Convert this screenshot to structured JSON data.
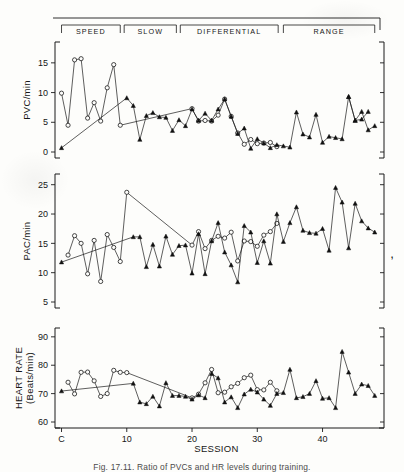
{
  "figure": {
    "caption": "Fig. 17.11.  Ratio of PVCs and HR levels during training.",
    "phases": [
      {
        "label": "SPEED",
        "start_session": 0.0,
        "end_session": 9.0
      },
      {
        "label": "SLOW",
        "start_session": 9.6,
        "end_session": 17.6
      },
      {
        "label": "DIFFERENTIAL",
        "start_session": 18.2,
        "end_session": 33.2
      },
      {
        "label": "RANGE",
        "start_session": 34.0,
        "end_session": 48.0
      }
    ],
    "x_axis": {
      "label": "SESSION",
      "tick_labels": [
        "C",
        "10",
        "20",
        "30",
        "40"
      ],
      "tick_values": [
        0,
        10,
        20,
        30,
        40
      ],
      "min": -1,
      "max": 48.5
    },
    "legend": {
      "open_marker": "open-circle-square",
      "filled_marker": "filled-triangle"
    }
  },
  "chart_data": [
    {
      "type": "line",
      "panel": "top",
      "title": "",
      "xlabel": "",
      "ylabel": "PVC/min",
      "ylim": [
        0,
        17.5
      ],
      "xlim": [
        -1,
        48.5
      ],
      "ytick_labels": [
        "0",
        "5",
        "10",
        "15"
      ],
      "ytick_values": [
        0,
        5,
        10,
        15
      ],
      "grid": false,
      "legend_position": "none",
      "series": [
        {
          "name": "open",
          "marker": "open",
          "x": [
            0,
            1,
            2,
            3,
            4,
            5,
            6,
            7,
            8,
            9,
            20,
            21,
            22,
            23,
            24,
            25,
            26,
            27,
            28,
            29,
            30,
            31,
            32,
            33
          ],
          "values": [
            9.9,
            4.5,
            15.5,
            15.7,
            5.7,
            8.3,
            5.2,
            10.8,
            14.7,
            4.5,
            7.3,
            5.2,
            5.3,
            5.2,
            6.2,
            8.9,
            6.0,
            3.2,
            1.3,
            2.1,
            1.4,
            1.5,
            1.6,
            0.9
          ]
        },
        {
          "name": "filled",
          "marker": "filled",
          "x": [
            0,
            10,
            11,
            12,
            13,
            14,
            15,
            16,
            17,
            18,
            19,
            20,
            21,
            22,
            23,
            24,
            25,
            26,
            27,
            28,
            29,
            30,
            31,
            32,
            33,
            34,
            35,
            36,
            37,
            38,
            39,
            40,
            41,
            42,
            43,
            44,
            45,
            46,
            47
          ],
          "values": [
            0.7,
            9.1,
            7.8,
            2.1,
            6.1,
            6.6,
            5.9,
            5.8,
            3.6,
            5.4,
            4.4,
            7.2,
            5.3,
            6.5,
            5.3,
            7.2,
            8.9,
            6.0,
            3.1,
            4.0,
            0.6,
            2.2,
            1.5,
            0.7,
            1.2,
            1.0,
            0.8,
            6.7,
            3.0,
            2.5,
            6.3,
            1.6,
            2.6,
            2.4,
            2.2,
            9.3,
            5.3,
            5.5,
            6.8
          ]
        },
        {
          "name": "filled_tail",
          "marker": "filled",
          "x": [
            44,
            45,
            46,
            47,
            48
          ],
          "values": [
            9.3,
            5.3,
            6.8,
            3.7,
            4.4
          ]
        }
      ]
    },
    {
      "type": "line",
      "panel": "middle",
      "title": "",
      "xlabel": "",
      "ylabel": "PAC/min",
      "ylim": [
        5,
        25.8
      ],
      "xlim": [
        -1,
        48.5
      ],
      "ytick_labels": [
        "5",
        "10",
        "15",
        "20",
        "25"
      ],
      "ytick_values": [
        5,
        10,
        15,
        20,
        25
      ],
      "grid": false,
      "legend_position": "none",
      "series": [
        {
          "name": "open",
          "marker": "open",
          "x": [
            1,
            2,
            3,
            4,
            5,
            6,
            7,
            8,
            9,
            10,
            20,
            21,
            22,
            23,
            24,
            25,
            26,
            27,
            28,
            29,
            30,
            31,
            32,
            33
          ],
          "values": [
            13.0,
            16.3,
            15.0,
            9.8,
            15.5,
            8.5,
            16.5,
            14.3,
            11.9,
            23.7,
            14.7,
            17.0,
            14.1,
            15.5,
            16.2,
            15.9,
            16.9,
            12.0,
            15.4,
            15.3,
            14.5,
            16.4,
            17.0,
            18.4
          ]
        },
        {
          "name": "filled",
          "marker": "filled",
          "x": [
            0,
            11,
            12,
            13,
            14,
            15,
            16,
            17,
            18,
            19,
            20,
            21,
            22,
            23,
            24,
            25,
            26,
            27,
            28,
            29,
            30,
            31,
            32,
            33,
            34,
            35,
            36,
            37,
            38,
            39,
            40,
            41,
            42,
            43,
            44,
            45,
            46,
            47,
            48
          ],
          "values": [
            11.8,
            16.1,
            16.1,
            11.0,
            14.8,
            11.1,
            16.2,
            13.1,
            14.6,
            14.7,
            9.9,
            16.6,
            9.8,
            15.4,
            18.5,
            13.5,
            11.3,
            8.4,
            18.0,
            16.9,
            11.7,
            15.4,
            11.6,
            20.0,
            15.3,
            18.5,
            21.2,
            17.2,
            16.8,
            16.7,
            17.5,
            13.8,
            24.5,
            22.0,
            14.2,
            21.8,
            18.8,
            17.6,
            16.9
          ]
        }
      ]
    },
    {
      "type": "line",
      "panel": "bottom",
      "title": "",
      "xlabel": "SESSION",
      "ylabel": "HEART RATE (Beats/min)",
      "ylim": [
        60,
        91
      ],
      "xlim": [
        -1,
        48.5
      ],
      "ytick_labels": [
        "60",
        "70",
        "80",
        "90"
      ],
      "ytick_values": [
        60,
        70,
        80,
        90
      ],
      "grid": false,
      "legend_position": "none",
      "series": [
        {
          "name": "open",
          "marker": "open",
          "x": [
            1,
            2,
            3,
            4,
            5,
            6,
            7,
            8,
            9,
            10,
            20,
            21,
            22,
            23,
            24,
            25,
            26,
            27,
            28,
            29,
            30,
            31,
            32,
            33
          ],
          "values": [
            74.0,
            69.9,
            77.5,
            77.6,
            74.5,
            69.0,
            70.0,
            78.2,
            77.5,
            77.4,
            68.5,
            69.8,
            73.8,
            78.5,
            70.3,
            70.5,
            72.4,
            73.6,
            75.6,
            76.5,
            71.4,
            71.3,
            74.0,
            71.0
          ]
        },
        {
          "name": "filled",
          "marker": "filled",
          "x": [
            0,
            11,
            12,
            13,
            14,
            15,
            16,
            17,
            18,
            19,
            20,
            21,
            22,
            23,
            24,
            25,
            26,
            27,
            28,
            29,
            30,
            31,
            32,
            33,
            34,
            35,
            36,
            37,
            38,
            39,
            40,
            41,
            42,
            43,
            44,
            45,
            46,
            47,
            48
          ],
          "values": [
            70.9,
            73.6,
            67.0,
            66.4,
            69.0,
            65.6,
            73.8,
            69.3,
            69.3,
            69.0,
            68.0,
            69.5,
            68.5,
            77.0,
            75.5,
            67.0,
            68.8,
            65.0,
            69.8,
            71.5,
            70.5,
            68.0,
            65.8,
            70.0,
            70.3,
            78.5,
            68.5,
            68.9,
            70.0,
            74.5,
            68.3,
            68.5,
            65.0,
            84.8,
            77.5,
            70.0,
            73.3,
            72.8,
            69.3
          ]
        }
      ]
    }
  ]
}
